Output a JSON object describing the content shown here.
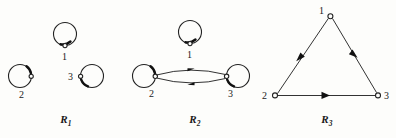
{
  "figure": {
    "width": 396,
    "height": 138,
    "background_color": "#fdfdfb",
    "ink_color": "#1a1a1a",
    "line_color": "#333333"
  },
  "panels": [
    {
      "id": "r1",
      "caption_base": "R",
      "caption_sub": "1",
      "nodes": [
        {
          "label": "1",
          "x": 65,
          "y": 44
        },
        {
          "label": "2",
          "x": 22,
          "y": 86
        },
        {
          "label": "3",
          "x": 88,
          "y": 84
        }
      ],
      "self_loops": 3,
      "edges": []
    },
    {
      "id": "r2",
      "caption_base": "R",
      "caption_sub": "2",
      "nodes": [
        {
          "label": "1",
          "x": 62,
          "y": 42
        },
        {
          "label": "2",
          "x": 18,
          "y": 80
        },
        {
          "label": "3",
          "x": 110,
          "y": 80
        }
      ],
      "self_loops": 3,
      "edges": [
        {
          "from": "2",
          "to": "3",
          "style": "curved-upper"
        },
        {
          "from": "3",
          "to": "2",
          "style": "curved-lower"
        }
      ]
    },
    {
      "id": "r3",
      "caption_base": "R",
      "caption_sub": "3",
      "nodes": [
        {
          "label": "1",
          "x": 72,
          "y": 16
        },
        {
          "label": "2",
          "x": 16,
          "y": 95
        },
        {
          "label": "3",
          "x": 120,
          "y": 95
        }
      ],
      "self_loops": 0,
      "edges": [
        {
          "from": "1",
          "to": "2",
          "style": "straight"
        },
        {
          "from": "1",
          "to": "3",
          "style": "straight"
        },
        {
          "from": "2",
          "to": "3",
          "style": "straight"
        }
      ]
    }
  ]
}
